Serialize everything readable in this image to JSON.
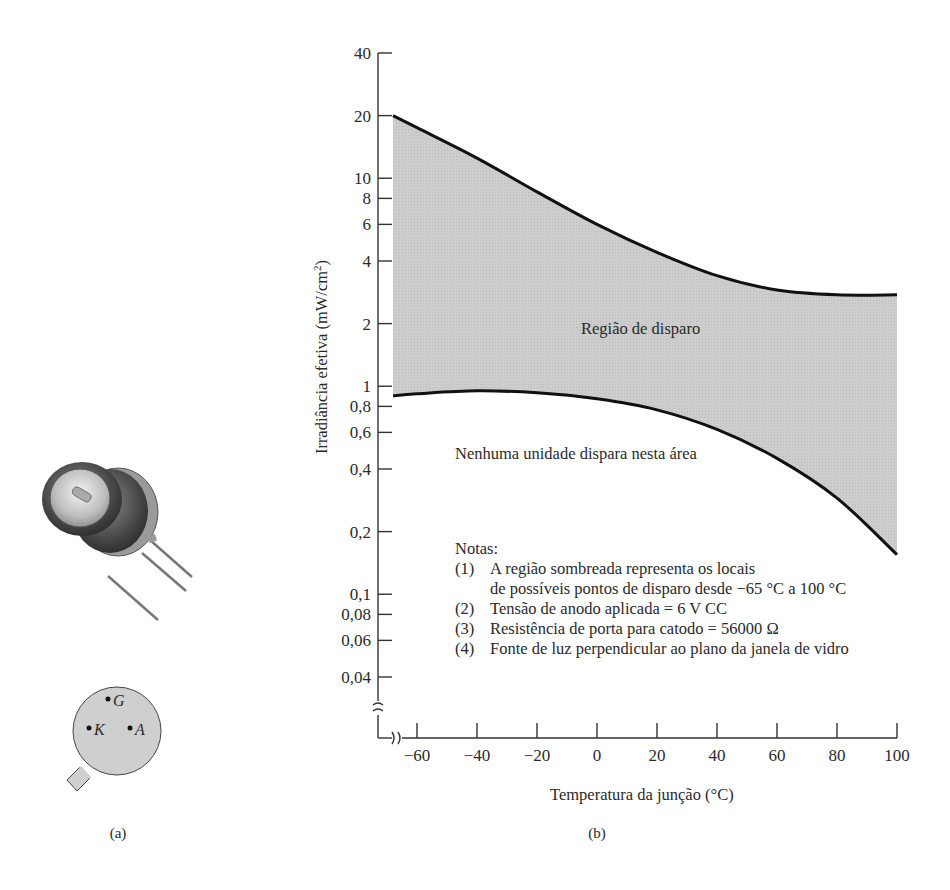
{
  "figure": {
    "panel_a": {
      "caption": "(a)",
      "pin_labels": {
        "gate": "G",
        "cathode": "K",
        "anode": "A"
      }
    },
    "panel_b": {
      "caption": "(b)"
    }
  },
  "chart_data": {
    "type": "area",
    "title": "",
    "xlabel": "Temperatura da junção (°C)",
    "ylabel": "Irradiância efetiva (mW/cm²)",
    "ylabel_main": "Irradiância efetiva (mW/cm",
    "ylabel_sup": "2",
    "ylabel_tail": ")",
    "xscale": "linear",
    "yscale": "log",
    "xlim": [
      -68,
      100
    ],
    "ylim": [
      0.03,
      40
    ],
    "grid": false,
    "axis_breaks": [
      "x",
      "y"
    ],
    "x_ticks": [
      -60,
      -40,
      -20,
      0,
      20,
      40,
      60,
      80,
      100
    ],
    "x_tick_labels": [
      "−60",
      "−40",
      "−20",
      "0",
      "20",
      "40",
      "60",
      "80",
      "100"
    ],
    "y_ticks": [
      40,
      20,
      10,
      8,
      6,
      4,
      2,
      1,
      0.8,
      0.6,
      0.4,
      0.2,
      0.1,
      0.08,
      0.06,
      0.04
    ],
    "y_tick_labels": [
      "40",
      "20",
      "10",
      "8",
      "6",
      "4",
      "2",
      "1",
      "0,8",
      "0,6",
      "0,4",
      "0,2",
      "0,1",
      "0,08",
      "0,06",
      "0,04"
    ],
    "series": [
      {
        "name": "upper boundary",
        "x": [
          -68,
          -60,
          -40,
          -20,
          0,
          20,
          40,
          60,
          80,
          100
        ],
        "values": [
          20,
          17.5,
          12.5,
          8.6,
          6.0,
          4.4,
          3.4,
          2.9,
          2.75,
          2.75
        ]
      },
      {
        "name": "lower boundary",
        "x": [
          -68,
          -60,
          -40,
          -20,
          0,
          20,
          40,
          60,
          80,
          100
        ],
        "values": [
          0.9,
          0.92,
          0.95,
          0.93,
          0.87,
          0.77,
          0.62,
          0.45,
          0.29,
          0.155
        ]
      }
    ],
    "shaded_region": {
      "between": [
        "upper boundary",
        "lower boundary"
      ],
      "color": "#cfcfcf"
    },
    "annotations": {
      "region_label": "Região de disparo",
      "no_trigger_label": "Nenhuma unidade dispara nesta área",
      "notes_title": "Notas:",
      "notes": [
        {
          "num": "(1)",
          "line1": "A região sombreada representa os locais",
          "line2": "de possíveis pontos de disparo desde −65 °C a 100 °C"
        },
        {
          "num": "(2)",
          "line1": "Tensão de anodo aplicada = 6 V CC"
        },
        {
          "num": "(3)",
          "line1": "Resistência de porta para catodo = 56000 Ω"
        },
        {
          "num": "(4)",
          "line1": "Fonte de luz perpendicular ao plano da janela de vidro"
        }
      ]
    },
    "colors": {
      "curve": "#111111",
      "fill": "#cfcfcf",
      "axis": "#333333"
    }
  }
}
